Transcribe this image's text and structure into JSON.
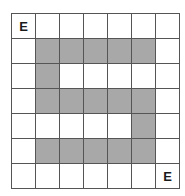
{
  "figure": {
    "kind": "grid-puzzle",
    "rows": 7,
    "columns": 7
  },
  "colors": {
    "background": "#ffffff",
    "cell_empty": "#ffffff",
    "cell_shaded": "#a8a8a8",
    "grid_line": "#555555",
    "label_text": "#1a1a1a"
  },
  "labels": [
    {
      "text": "E",
      "row": 1,
      "col": 1
    },
    {
      "text": "E",
      "row": 7,
      "col": 7
    }
  ],
  "grid": {
    "rows": [
      {
        "index": 1,
        "cells": [
          {
            "col": 1,
            "shaded": false,
            "label": "E"
          },
          {
            "col": 2,
            "shaded": false,
            "label": ""
          },
          {
            "col": 3,
            "shaded": false,
            "label": ""
          },
          {
            "col": 4,
            "shaded": false,
            "label": ""
          },
          {
            "col": 5,
            "shaded": false,
            "label": ""
          },
          {
            "col": 6,
            "shaded": false,
            "label": ""
          },
          {
            "col": 7,
            "shaded": false,
            "label": ""
          }
        ]
      },
      {
        "index": 2,
        "cells": [
          {
            "col": 1,
            "shaded": false,
            "label": ""
          },
          {
            "col": 2,
            "shaded": true,
            "label": ""
          },
          {
            "col": 3,
            "shaded": true,
            "label": ""
          },
          {
            "col": 4,
            "shaded": true,
            "label": ""
          },
          {
            "col": 5,
            "shaded": true,
            "label": ""
          },
          {
            "col": 6,
            "shaded": true,
            "label": ""
          },
          {
            "col": 7,
            "shaded": false,
            "label": ""
          }
        ]
      },
      {
        "index": 3,
        "cells": [
          {
            "col": 1,
            "shaded": false,
            "label": ""
          },
          {
            "col": 2,
            "shaded": true,
            "label": ""
          },
          {
            "col": 3,
            "shaded": false,
            "label": ""
          },
          {
            "col": 4,
            "shaded": false,
            "label": ""
          },
          {
            "col": 5,
            "shaded": false,
            "label": ""
          },
          {
            "col": 6,
            "shaded": false,
            "label": ""
          },
          {
            "col": 7,
            "shaded": false,
            "label": ""
          }
        ]
      },
      {
        "index": 4,
        "cells": [
          {
            "col": 1,
            "shaded": false,
            "label": ""
          },
          {
            "col": 2,
            "shaded": true,
            "label": ""
          },
          {
            "col": 3,
            "shaded": true,
            "label": ""
          },
          {
            "col": 4,
            "shaded": true,
            "label": ""
          },
          {
            "col": 5,
            "shaded": true,
            "label": ""
          },
          {
            "col": 6,
            "shaded": true,
            "label": ""
          },
          {
            "col": 7,
            "shaded": false,
            "label": ""
          }
        ]
      },
      {
        "index": 5,
        "cells": [
          {
            "col": 1,
            "shaded": false,
            "label": ""
          },
          {
            "col": 2,
            "shaded": false,
            "label": ""
          },
          {
            "col": 3,
            "shaded": false,
            "label": ""
          },
          {
            "col": 4,
            "shaded": false,
            "label": ""
          },
          {
            "col": 5,
            "shaded": false,
            "label": ""
          },
          {
            "col": 6,
            "shaded": true,
            "label": ""
          },
          {
            "col": 7,
            "shaded": false,
            "label": ""
          }
        ]
      },
      {
        "index": 6,
        "cells": [
          {
            "col": 1,
            "shaded": false,
            "label": ""
          },
          {
            "col": 2,
            "shaded": true,
            "label": ""
          },
          {
            "col": 3,
            "shaded": true,
            "label": ""
          },
          {
            "col": 4,
            "shaded": true,
            "label": ""
          },
          {
            "col": 5,
            "shaded": true,
            "label": ""
          },
          {
            "col": 6,
            "shaded": true,
            "label": ""
          },
          {
            "col": 7,
            "shaded": false,
            "label": ""
          }
        ]
      },
      {
        "index": 7,
        "cells": [
          {
            "col": 1,
            "shaded": false,
            "label": ""
          },
          {
            "col": 2,
            "shaded": false,
            "label": ""
          },
          {
            "col": 3,
            "shaded": false,
            "label": ""
          },
          {
            "col": 4,
            "shaded": false,
            "label": ""
          },
          {
            "col": 5,
            "shaded": false,
            "label": ""
          },
          {
            "col": 6,
            "shaded": false,
            "label": ""
          },
          {
            "col": 7,
            "shaded": false,
            "label": "E"
          }
        ]
      }
    ]
  }
}
